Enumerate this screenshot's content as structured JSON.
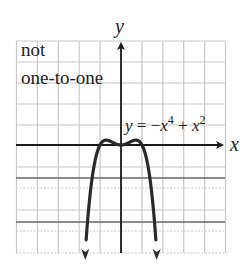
{
  "chart_data": {
    "type": "line",
    "title": "",
    "annotation": "not one-to-one",
    "annotation_lines": [
      "not",
      "one-to-one"
    ],
    "equation": "y = -x^4 + x^2",
    "equation_parts": {
      "lhs": "y",
      "eq": " = ",
      "minus": "−",
      "x1": "x",
      "exp1": "4",
      "plus": " + ",
      "x2": "x",
      "exp2": "2"
    },
    "xlabel": "x",
    "ylabel": "y",
    "function": "-x^4 + x^2",
    "xlim": [
      -5,
      5
    ],
    "ylim": [
      -5.4,
      5.2
    ],
    "grid": true,
    "series": [
      {
        "name": "y = -x^4 + x^2",
        "x": [
          -1.7,
          -1.5,
          -1.25,
          -1.0,
          -0.85,
          -0.707,
          -0.5,
          -0.25,
          0,
          0.25,
          0.5,
          0.707,
          0.85,
          1.0,
          1.25,
          1.5,
          1.7
        ],
        "y": [
          -5.46,
          -2.81,
          -0.88,
          0,
          0.2,
          0.25,
          0.19,
          0.06,
          0,
          0.06,
          0.19,
          0.25,
          0.2,
          0,
          -0.88,
          -2.81,
          -5.46
        ],
        "arrows": "both ends downward"
      }
    ],
    "key_points": {
      "x_intercepts": [
        -1,
        0,
        1
      ],
      "local_maxima": [
        [
          -0.707,
          0.25
        ],
        [
          0.707,
          0.25
        ]
      ],
      "local_minimum": [
        0,
        0
      ]
    }
  },
  "colors": {
    "curve": "#2a2a2a",
    "axis": "#1a1a1a",
    "grid": "#c8c8c8",
    "dark_grid": "#666666",
    "text": "#222222"
  }
}
